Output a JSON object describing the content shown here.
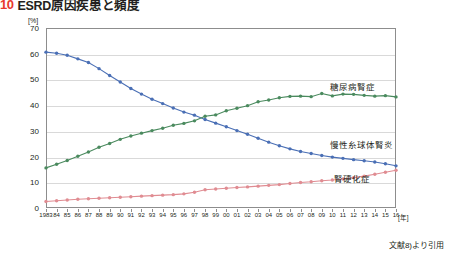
{
  "title": {
    "number": "10",
    "text": "ESRD原因疾患と頻度"
  },
  "credit": "文献8)より引用",
  "axis": {
    "y_unit": "[%]",
    "x_unit": "[年]"
  },
  "labels": {
    "dm": "糖尿病腎症",
    "gn": "慢性糸球体腎炎",
    "ns": "腎硬化症"
  },
  "colors": {
    "diabetic_nephropathy": "#4a8a5e",
    "chronic_glomerulonephritis": "#4a6fb5",
    "nephrosclerosis": "#e08c92",
    "title_number": "#e8392c",
    "frame": "#8d8d8d",
    "grid": "#d9d9d9"
  },
  "chart_data": {
    "type": "line",
    "title": "ESRD原因疾患と頻度",
    "xlabel": "[年]",
    "ylabel": "[%]",
    "ylim": [
      0,
      70
    ],
    "yticks": [
      0,
      10,
      20,
      30,
      40,
      50,
      60,
      70
    ],
    "grid": true,
    "legend": "inline-labels",
    "categories": [
      "1983",
      "84",
      "85",
      "86",
      "87",
      "88",
      "89",
      "90",
      "91",
      "92",
      "93",
      "94",
      "95",
      "96",
      "97",
      "98",
      "99",
      "00",
      "01",
      "02",
      "03",
      "04",
      "05",
      "06",
      "07",
      "08",
      "09",
      "10",
      "11",
      "12",
      "13",
      "14",
      "15",
      "16"
    ],
    "series": [
      {
        "name": "慢性糸球体腎炎",
        "color": "#4a6fb5",
        "values": [
          60.6,
          60.2,
          59.4,
          58.0,
          56.6,
          54.2,
          51.5,
          49.0,
          46.5,
          44.3,
          42.3,
          40.6,
          38.9,
          37.3,
          36.1,
          34.4,
          33.0,
          31.6,
          30.1,
          28.7,
          27.1,
          25.6,
          24.2,
          23.0,
          22.0,
          21.2,
          20.4,
          19.8,
          19.3,
          18.8,
          18.4,
          17.9,
          17.2,
          16.4
        ]
      },
      {
        "name": "糖尿病腎症",
        "color": "#4a8a5e",
        "values": [
          15.6,
          17.0,
          18.5,
          20.1,
          21.8,
          23.6,
          25.1,
          26.7,
          28.0,
          29.1,
          30.1,
          31.0,
          32.2,
          32.9,
          33.9,
          35.7,
          36.2,
          37.8,
          38.8,
          39.8,
          41.3,
          42.0,
          42.9,
          43.4,
          43.5,
          43.3,
          44.5,
          43.6,
          44.3,
          44.2,
          43.8,
          43.5,
          43.7,
          43.2
        ]
      },
      {
        "name": "腎硬化症",
        "color": "#e08c92",
        "values": [
          2.5,
          2.8,
          3.1,
          3.4,
          3.6,
          3.8,
          4.0,
          4.2,
          4.4,
          4.6,
          4.8,
          5.0,
          5.2,
          5.5,
          6.1,
          7.1,
          7.4,
          7.7,
          8.0,
          8.2,
          8.5,
          8.8,
          9.1,
          9.5,
          9.9,
          10.2,
          10.6,
          10.9,
          11.3,
          11.8,
          12.4,
          13.1,
          13.9,
          14.7
        ]
      }
    ]
  }
}
